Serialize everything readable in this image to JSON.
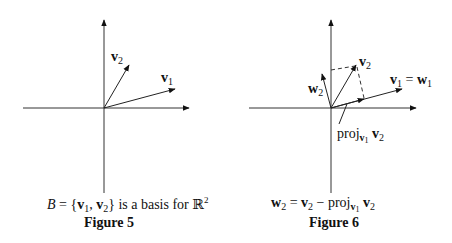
{
  "figures": [
    {
      "id": "figure-5",
      "title": "Figure 5",
      "caption_parts": {
        "lhs": "B",
        "eq": " = {",
        "v": "v",
        "s1": "1",
        "comma": ", ",
        "v2": "v",
        "s2": "2",
        "rest": "} is a basis for ",
        "R": "ℝ",
        "exp": "2"
      },
      "labels": {
        "v1": {
          "base": "v",
          "sub": "1"
        },
        "v2": {
          "base": "v",
          "sub": "2"
        }
      },
      "vectors": [
        {
          "name": "v1",
          "components": [
            2.0,
            0.55
          ]
        },
        {
          "name": "v2",
          "components": [
            0.7,
            1.2
          ]
        }
      ]
    },
    {
      "id": "figure-6",
      "title": "Figure 6",
      "caption_parts": {
        "w": "w",
        "ws": "2",
        "eq": " = ",
        "v": "v",
        "vs": "2",
        "minus": " − proj",
        "pv": "v",
        "ps": "1",
        "space": " ",
        "v2": "v",
        "v2s": "2"
      },
      "labels": {
        "v1w1": {
          "v": "v",
          "vs": "1",
          "eq": " = ",
          "w": "w",
          "ws": "1"
        },
        "v2": {
          "base": "v",
          "sub": "2"
        },
        "w2": {
          "base": "w",
          "sub": "2"
        },
        "proj": {
          "text": "proj",
          "v": "v",
          "vs": "1",
          "space": " ",
          "v2": "v",
          "v2s": "2"
        }
      },
      "vectors": [
        {
          "name": "v1",
          "components": [
            2.0,
            0.55
          ]
        },
        {
          "name": "v2",
          "components": [
            0.7,
            1.2
          ]
        },
        {
          "name": "w2",
          "components": [
            -0.25,
            0.95
          ]
        },
        {
          "name": "proj_v1_v2",
          "components": [
            0.95,
            0.26
          ]
        }
      ]
    }
  ]
}
